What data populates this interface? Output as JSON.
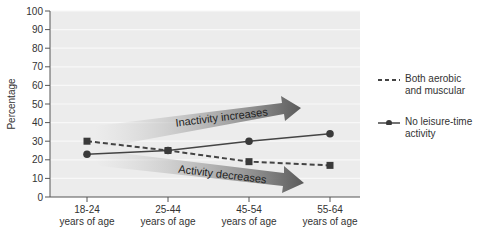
{
  "chart_data": {
    "type": "line",
    "title": "",
    "xlabel": "",
    "ylabel": "Percentage",
    "ylim": [
      0,
      100
    ],
    "yticks": [
      0,
      10,
      20,
      30,
      40,
      50,
      60,
      70,
      80,
      90,
      100
    ],
    "categories": [
      "18-24 years of age",
      "25-44 years of age",
      "45-54 years of age",
      "55-64 years of age"
    ],
    "category_lines": [
      [
        "18-24",
        "years of age"
      ],
      [
        "25-44",
        "years of age"
      ],
      [
        "45-54",
        "years of age"
      ],
      [
        "55-64",
        "years of age"
      ]
    ],
    "series": [
      {
        "name": "Both aerobic and muscular",
        "style": "dashed",
        "marker": "square",
        "values": [
          30,
          25,
          19,
          17
        ]
      },
      {
        "name": "No leisure-time activity",
        "style": "solid",
        "marker": "circle",
        "values": [
          23,
          25,
          30,
          34
        ]
      }
    ],
    "annotations": [
      {
        "text": "Inactivity increases",
        "type": "arrow-up"
      },
      {
        "text": "Activity decreases",
        "type": "arrow-down"
      }
    ],
    "grid": true,
    "legend_position": "right"
  },
  "legend": {
    "items": [
      {
        "line1": "Both aerobic",
        "line2": "and muscular"
      },
      {
        "line1": "No leisure-time",
        "line2": "activity"
      }
    ]
  },
  "colors": {
    "plot_bg": "#ececec",
    "line": "#444444",
    "marker": "#3a3a3a",
    "arrow_dark": "#555555"
  }
}
